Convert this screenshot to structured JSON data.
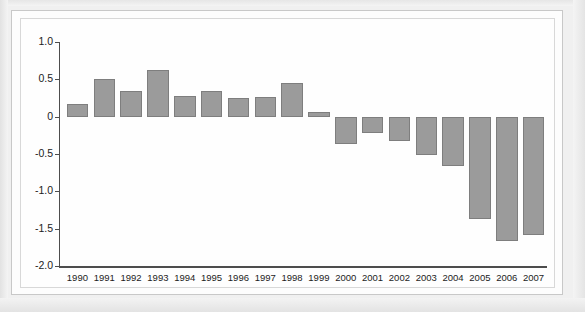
{
  "chart_data": {
    "type": "bar",
    "title": "",
    "subtitle": "",
    "xlabel": "",
    "ylabel": "",
    "categories": [
      "1990",
      "1991",
      "1992",
      "1993",
      "1994",
      "1995",
      "1996",
      "1997",
      "1998",
      "1999",
      "2000",
      "2001",
      "2002",
      "2003",
      "2004",
      "2005",
      "2006",
      "2007"
    ],
    "values": [
      0.17,
      0.5,
      0.35,
      0.63,
      0.28,
      0.35,
      0.25,
      0.26,
      0.45,
      0.06,
      -0.37,
      -0.22,
      -0.32,
      -0.52,
      -0.66,
      -1.37,
      -1.67,
      -1.59
    ],
    "ylim": [
      -2.0,
      1.0
    ],
    "y_ticks": [
      "1.0",
      "0.5",
      "0",
      "-0.5",
      "-1.0",
      "-1.5",
      "-2.0"
    ],
    "y_tick_values": [
      1.0,
      0.5,
      0,
      -0.5,
      -1.0,
      -1.5,
      -2.0
    ],
    "grid": false,
    "legend": null,
    "legend_position": "none",
    "annotations": [],
    "bar_color": "#9b9b9b",
    "bar_border_color": "#7e7e7e",
    "axis_color": "#4d4d4d",
    "background_color": "#fefefe",
    "page_background_color": "#f0f0f0"
  }
}
